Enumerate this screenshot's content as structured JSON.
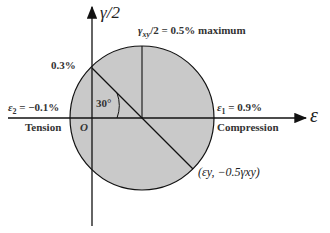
{
  "diagram": {
    "type": "Mohr's circle for strain",
    "axes": {
      "vertical_label": "γ/2",
      "horizontal_label": "ε",
      "origin_label": "O"
    },
    "labels": {
      "max_shear": "γxy/2 = 0.5% maximum",
      "max_shear_sym": "γ",
      "max_shear_sub": "xy",
      "max_shear_rest": "/2 = 0.5% maximum",
      "point_upper": "0.3%",
      "eps2": "ε2 = −0.1%",
      "eps2_sym": "ε",
      "eps2_sub": "2",
      "eps2_rest": " = −0.1%",
      "eps1": "ε1 = 0.9%",
      "eps1_sym": "ε",
      "eps1_sub": "1",
      "eps1_rest": " = 0.9%",
      "angle": "30°",
      "tension": "Tension",
      "compression": "Compression",
      "point_lower": "(εy, −0.5γxy)"
    },
    "values": {
      "center_strain_pct": 0.4,
      "radius_pct": 0.5,
      "eps1_pct": 0.9,
      "eps2_pct": -0.1,
      "max_half_shear_pct": 0.5,
      "angle_deg": 30
    },
    "colors": {
      "circle_fill": "#c9c9c9",
      "line": "#111111",
      "text": "#333333"
    }
  }
}
